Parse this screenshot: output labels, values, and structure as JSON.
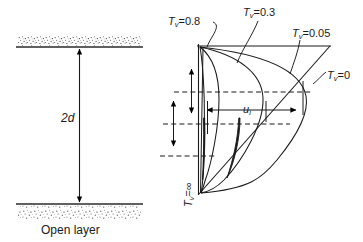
{
  "figure": {
    "left_diagram": {
      "name": "open-layer-section",
      "caption": "Open layer",
      "thickness_label": "2d",
      "top_boundary_name": "permeable-sand-top",
      "bottom_boundary_name": "permeable-sand-bottom"
    },
    "right_diagram": {
      "name": "isochrone-diagram",
      "pressure_label": "u",
      "pressure_label_sub": "i",
      "isochrones": [
        {
          "id": "tv-08",
          "label_prefix": "T",
          "label_sub": "v",
          "label_value": "=0.8"
        },
        {
          "id": "tv-03",
          "label_prefix": "T",
          "label_sub": "v",
          "label_value": "=0.3"
        },
        {
          "id": "tv-005",
          "label_prefix": "T",
          "label_sub": "v",
          "label_value": "=0.05"
        },
        {
          "id": "tv-0",
          "label_prefix": "T",
          "label_sub": "v",
          "label_value": "=0"
        },
        {
          "id": "tv-inf",
          "label_prefix": "T",
          "label_sub": "v",
          "label_value": "=∞"
        }
      ]
    }
  },
  "colors": {
    "ink": "#1a1a1a",
    "line": "#000000",
    "stipple": "#4d4d4d",
    "background": "#ffffff"
  }
}
